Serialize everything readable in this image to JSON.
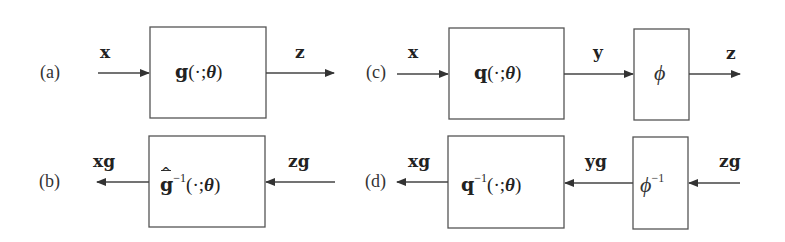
{
  "diagram": {
    "panels": {
      "a": {
        "label": "(a)",
        "input_signal": "x",
        "block": {
          "name": "g",
          "args": "(·;",
          "theta": "θ",
          "close": ")"
        },
        "output_signal": "z",
        "direction": "left-to-right"
      },
      "b": {
        "label": "(b)",
        "input_signal": "zg",
        "block": {
          "hat": "^",
          "name": "g",
          "sup": "−1",
          "args": "(·;",
          "theta": "θ",
          "close": ")"
        },
        "output_signal": "xg",
        "direction": "right-to-left"
      },
      "c": {
        "label": "(c)",
        "input_signal": "x",
        "block1": {
          "name": "q",
          "args": "(·;",
          "theta": "θ",
          "close": ")"
        },
        "mid_signal": "y",
        "block2": {
          "name": "ϕ"
        },
        "output_signal": "z",
        "direction": "left-to-right"
      },
      "d": {
        "label": "(d)",
        "input_signal": "zg",
        "block2": {
          "name": "ϕ",
          "sup": "−1"
        },
        "mid_signal": "yg",
        "block1": {
          "name": "q",
          "sup": "−1",
          "args": "(·;",
          "theta": "θ",
          "close": ")"
        },
        "output_signal": "xg",
        "direction": "right-to-left"
      }
    },
    "colors": {
      "stroke": "#555555",
      "text": "#222222",
      "background": "#ffffff"
    }
  }
}
